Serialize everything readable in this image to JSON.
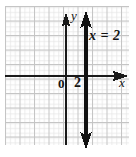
{
  "figure": {
    "kind": "coordinate-plane-graph",
    "background_color": "#ffffff",
    "grid": {
      "visible": true,
      "major_color": "#c6c6c6",
      "minor_color": "#e2e2e2",
      "major_spacing_px": 14.5,
      "minor_per_major": 3,
      "left_px": 5,
      "top_px": 6,
      "right_px": 129,
      "bottom_px": 145
    },
    "axes": {
      "color": "#1a1a1a",
      "origin_label": "0",
      "x_axis": {
        "label": "x",
        "y_px": 76,
        "start_px": 5,
        "end_px": 126,
        "arrow_at_end": true,
        "arrow_at_start": false
      },
      "y_axis": {
        "label": "y",
        "x_px": 66,
        "start_px": 14,
        "end_px": 145,
        "arrow_at_start": true,
        "arrow_at_end": false
      }
    },
    "plotted_line": {
      "equation": "x = 2",
      "label": "x = 2",
      "tick_label": "2",
      "color": "#111111",
      "width_px": 3,
      "x_px": 86,
      "top_px": 14,
      "bottom_px": 147,
      "arrow_top": true,
      "arrow_bottom": true
    }
  }
}
